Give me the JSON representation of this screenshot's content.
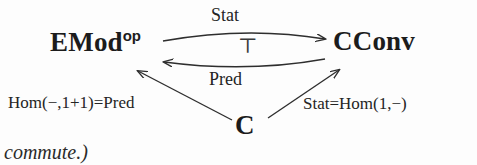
{
  "diagram": {
    "type": "category-theory-adjunction-diagram",
    "nodes": [
      {
        "id": "emod",
        "base": "EMod",
        "superscript": "op",
        "full": "EMod^op"
      },
      {
        "id": "cconv",
        "base": "CConv",
        "superscript": "",
        "full": "CConv"
      },
      {
        "id": "c",
        "base": "C",
        "superscript": "",
        "full": "C"
      }
    ],
    "edges": [
      {
        "id": "stat-top",
        "from": "emod",
        "to": "cconv",
        "label": "Stat",
        "style": "curved-arrow-right",
        "label_position": "above"
      },
      {
        "id": "pred-bottom",
        "from": "cconv",
        "to": "emod",
        "label": "Pred",
        "style": "curved-arrow-left",
        "label_position": "below"
      },
      {
        "id": "hom-left",
        "from": "c",
        "to": "emod",
        "label": "Hom(−,1+1)=Pred",
        "style": "straight-arrow-up-left",
        "label_position": "left"
      },
      {
        "id": "stat-right",
        "from": "c",
        "to": "cconv",
        "label": "Stat=Hom(1,−)",
        "style": "straight-arrow-up-right",
        "label_position": "right"
      }
    ],
    "adjunction_symbol": "⊤",
    "caption": "commute.)",
    "colors": {
      "background": "#fdfdfd",
      "ink": "#1c1c1c",
      "stroke": "#2e2e2e"
    }
  }
}
